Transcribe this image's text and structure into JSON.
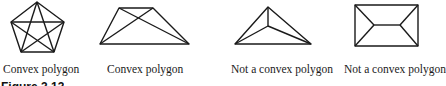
{
  "figure": {
    "label": "Figure 3.13",
    "stroke_color": "#1a1a1a",
    "panels": [
      {
        "id": "pentagon",
        "caption": "Convex polygon",
        "convex": true,
        "vertices": [
          [
            37,
            2
          ],
          [
            64,
            22
          ],
          [
            54,
            52
          ],
          [
            21,
            52
          ],
          [
            11,
            22
          ]
        ],
        "extra_lines": [
          [
            [
              37,
              2
            ],
            [
              54,
              52
            ]
          ],
          [
            [
              37,
              2
            ],
            [
              21,
              52
            ]
          ],
          [
            [
              64,
              22
            ],
            [
              11,
              22
            ]
          ],
          [
            [
              64,
              22
            ],
            [
              21,
              52
            ]
          ],
          [
            [
              11,
              22
            ],
            [
              54,
              52
            ]
          ]
        ]
      },
      {
        "id": "trapezoid",
        "caption": "Convex polygon",
        "convex": true,
        "vertices": [
          [
            119,
            8
          ],
          [
            153,
            8
          ],
          [
            189,
            44
          ],
          [
            100,
            44
          ]
        ],
        "extra_lines": [
          [
            [
              119,
              8
            ],
            [
              189,
              44
            ]
          ],
          [
            [
              153,
              8
            ],
            [
              100,
              44
            ]
          ]
        ]
      },
      {
        "id": "arrowhead",
        "caption": "Not a convex polygon",
        "convex": false,
        "vertices": [
          [
            235,
            44
          ],
          [
            268,
            7
          ],
          [
            311,
            44
          ]
        ],
        "extra_lines": [
          [
            [
              268,
              7
            ],
            [
              268,
              26
            ]
          ],
          [
            [
              268,
              26
            ],
            [
              235,
              44
            ]
          ],
          [
            [
              268,
              26
            ],
            [
              311,
              44
            ]
          ]
        ]
      },
      {
        "id": "envelope",
        "caption": "Not a convex polygon",
        "convex": false,
        "vertices": [
          [
            355,
            5
          ],
          [
            418,
            5
          ],
          [
            418,
            46
          ],
          [
            355,
            46
          ]
        ],
        "extra_lines": [
          [
            [
              355,
              5
            ],
            [
              374,
              25
            ]
          ],
          [
            [
              355,
              46
            ],
            [
              374,
              25
            ]
          ],
          [
            [
              374,
              25
            ],
            [
              400,
              25
            ]
          ],
          [
            [
              400,
              25
            ],
            [
              418,
              5
            ]
          ],
          [
            [
              400,
              25
            ],
            [
              418,
              46
            ]
          ]
        ]
      }
    ]
  }
}
